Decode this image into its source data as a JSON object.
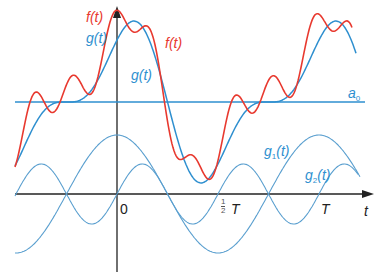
{
  "colors": {
    "f_curve": "#e8392f",
    "g_curve": "#2e8fcf",
    "harmonics": "#5a9fcf",
    "axes": "#222222",
    "background": "#ffffff"
  },
  "labels": {
    "f_axis": "f(t)",
    "g_axis": "g(t)",
    "f_curve": "f(t)",
    "g_curve": "g(t)",
    "a0_base": "a",
    "a0_sub": "0",
    "g1_base": "g",
    "g1_sub": "1",
    "g1_arg": "(t)",
    "g2_base": "g",
    "g2_sub": "2",
    "g2_arg": "(t)",
    "origin": "0",
    "half_period_num": "1",
    "half_period_den": "2",
    "half_period_T": "T",
    "period": "T",
    "t_axis": "t"
  },
  "diagram": {
    "components": [
      "f(t)",
      "g(t)",
      "a0",
      "g1(t)",
      "g2(t)"
    ],
    "axis_ticks": [
      "0",
      "1/2 T",
      "T"
    ]
  }
}
